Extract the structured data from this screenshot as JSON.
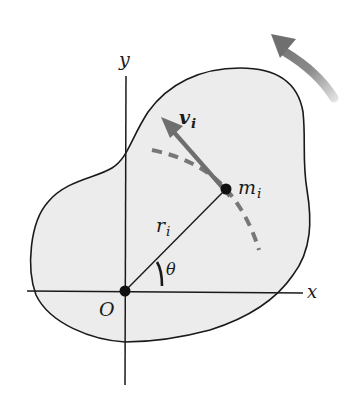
{
  "figure": {
    "colors": {
      "body_fill": "#ececec",
      "outline": "#1a1a1a",
      "accent_gray": "#777777",
      "background": "#ffffff"
    }
  },
  "labels": {
    "y_axis": "y",
    "x_axis": "x",
    "origin": "O",
    "mass": "m",
    "mass_sub": "i",
    "radius": "r",
    "radius_sub": "i",
    "velocity": "v",
    "velocity_sub": "i",
    "angle": "θ"
  },
  "elements": {
    "rotation_arrow": "counterclockwise rotation indicator",
    "velocity_vector": "tangential velocity arrow at m_i",
    "path_arc": "dashed circular path of m_i",
    "radius_line": "line from O to m_i"
  }
}
